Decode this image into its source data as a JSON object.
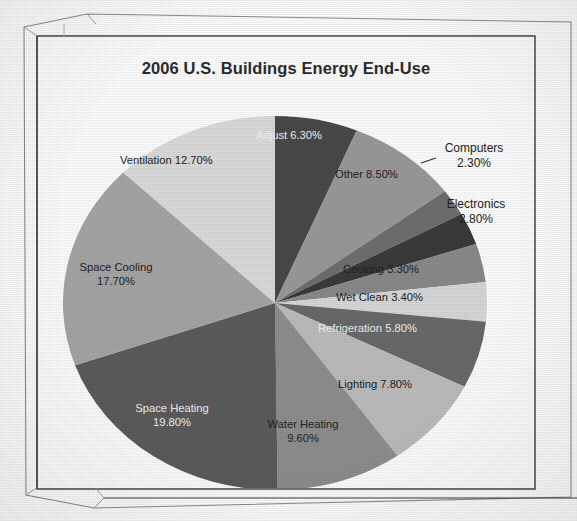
{
  "chart": {
    "title": "2006 U.S. Buildings Energy End-Use"
  },
  "chart_data": {
    "type": "pie",
    "title": "2006 U.S. Buildings Energy End-Use",
    "xlabel": "",
    "ylabel": "",
    "legend": "none",
    "units": "percent",
    "start_angle_deg": 0,
    "direction": "clockwise",
    "categories": [
      "Adjust",
      "Other",
      "Computers",
      "Electronics",
      "Cooking",
      "Wet Clean",
      "Refrigeration",
      "Lighting",
      "Water Heating",
      "Space Heating",
      "Space Cooling",
      "Ventilation"
    ],
    "values": [
      6.3,
      8.5,
      2.3,
      2.8,
      3.3,
      3.4,
      5.8,
      7.8,
      9.6,
      19.8,
      17.7,
      12.7
    ],
    "value_labels": [
      "6.30%",
      "8.50%",
      "2.30%",
      "2.80%",
      "3.30%",
      "3.40%",
      "5.80%",
      "7.80%",
      "9.60%",
      "19.80%",
      "17.70%",
      "12.70%"
    ],
    "colors": [
      "#4a4a4a",
      "#9a9a9a",
      "#6f6f6f",
      "#3b3b3b",
      "#8a8a8a",
      "#d8d8d8",
      "#6a6a6a",
      "#bdbdbd",
      "#8f8f8f",
      "#5c5c5c",
      "#a6a6a6",
      "#dcdcdc"
    ],
    "slices": [
      {
        "name": "Adjust",
        "label": "Adjust 6.30%",
        "value": 6.3,
        "pct_text": "6.30%",
        "color": "#4a4a4a",
        "placement": "inside"
      },
      {
        "name": "Other",
        "label": "Other 8.50%",
        "value": 8.5,
        "pct_text": "8.50%",
        "color": "#9a9a9a",
        "placement": "inside"
      },
      {
        "name": "Computers",
        "label": "Computers",
        "value": 2.3,
        "pct_text": "2.30%",
        "color": "#6f6f6f",
        "placement": "outside"
      },
      {
        "name": "Electronics",
        "label": "Electronics",
        "value": 2.8,
        "pct_text": "2.80%",
        "color": "#3b3b3b",
        "placement": "outside"
      },
      {
        "name": "Cooking",
        "label": "Cooking 3.30%",
        "value": 3.3,
        "pct_text": "3.30%",
        "color": "#8a8a8a",
        "placement": "inside"
      },
      {
        "name": "Wet Clean",
        "label": "Wet Clean  3.40%",
        "value": 3.4,
        "pct_text": "3.40%",
        "color": "#d8d8d8",
        "placement": "inside"
      },
      {
        "name": "Refrigeration",
        "label": "Refrigeration 5.80%",
        "value": 5.8,
        "pct_text": "5.80%",
        "color": "#6a6a6a",
        "placement": "inside"
      },
      {
        "name": "Lighting",
        "label": "Lighting 7.80%",
        "value": 7.8,
        "pct_text": "7.80%",
        "color": "#bdbdbd",
        "placement": "inside"
      },
      {
        "name": "Water Heating",
        "label": "Water Heating",
        "value": 9.6,
        "pct_text": "9.60%",
        "color": "#8f8f8f",
        "placement": "inside"
      },
      {
        "name": "Space Heating",
        "label": "Space Heating",
        "value": 19.8,
        "pct_text": "19.80%",
        "color": "#5c5c5c",
        "placement": "inside"
      },
      {
        "name": "Space Cooling",
        "label": "Space Cooling",
        "value": 17.7,
        "pct_text": "17.70%",
        "color": "#a6a6a6",
        "placement": "inside"
      },
      {
        "name": "Ventilation",
        "label": "Ventilation 12.70%",
        "value": 12.7,
        "pct_text": "12.70%",
        "color": "#dcdcdc",
        "placement": "inside"
      }
    ]
  },
  "labels": {
    "adjust": "Adjust 6.30%",
    "other": "Other 8.50%",
    "computers_name": "Computers",
    "computers_pct": "2.30%",
    "electronics_name": "Electronics",
    "electronics_pct": "2.80%",
    "cooking": "Cooking 3.30%",
    "wet_clean": "Wet Clean  3.40%",
    "refrigeration": "Refrigeration 5.80%",
    "lighting": "Lighting 7.80%",
    "water_heating_name": "Water Heating",
    "water_heating_pct": "9.60%",
    "space_heating_name": "Space Heating",
    "space_heating_pct": "19.80%",
    "space_cooling_name": "Space Cooling",
    "space_cooling_pct": "17.70%",
    "ventilation": "Ventilation 12.70%"
  }
}
